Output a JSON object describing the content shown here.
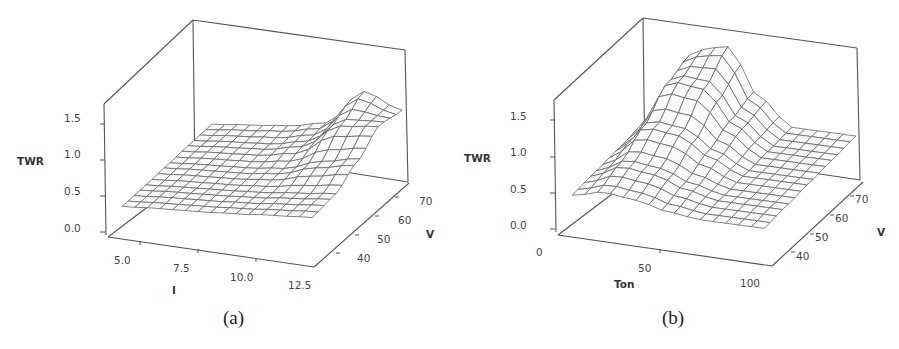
{
  "figure": {
    "panels": [
      {
        "id": "a",
        "caption": "(a)"
      },
      {
        "id": "b",
        "caption": "(b)"
      }
    ]
  },
  "chart_data": [
    {
      "type": "surface",
      "panel": "(a)",
      "title": "",
      "xlabel": "I",
      "ylabel": "V",
      "zlabel": "TWR",
      "x_ticks": [
        "5.0",
        "7.5",
        "10.0",
        "12.5"
      ],
      "y_ticks": [
        "40",
        "50",
        "60",
        "70"
      ],
      "z_ticks": [
        "0.0",
        "0.5",
        "1.0",
        "1.5"
      ],
      "xlim": [
        4,
        13
      ],
      "ylim": [
        35,
        75
      ],
      "zlim": [
        0,
        1.8
      ],
      "grid": "wireframe 15x15",
      "description": "Mostly flat surface around TWR ~0.3-0.5, with a ridge/peak rising to ~1.1 at high I (~11-12) and high V (~65-70); slight dip near I~9-10, V~50.",
      "x": [
        4.5,
        6.0,
        7.5,
        9.0,
        10.5,
        12.0
      ],
      "y": [
        38,
        46,
        54,
        62,
        70
      ],
      "z": [
        [
          0.3,
          0.33,
          0.35,
          0.38,
          0.42,
          0.45
        ],
        [
          0.32,
          0.35,
          0.37,
          0.4,
          0.45,
          0.5
        ],
        [
          0.35,
          0.38,
          0.4,
          0.45,
          0.6,
          0.7
        ],
        [
          0.38,
          0.42,
          0.45,
          0.55,
          0.9,
          0.95
        ],
        [
          0.4,
          0.45,
          0.5,
          0.6,
          1.1,
          0.9
        ]
      ]
    },
    {
      "type": "surface",
      "panel": "(b)",
      "title": "",
      "xlabel": "Ton",
      "ylabel": "V",
      "zlabel": "TWR",
      "x_ticks": [
        "0",
        "50",
        "100"
      ],
      "y_ticks": [
        "40",
        "50",
        "60",
        "70"
      ],
      "z_ticks": [
        "0.0",
        "0.5",
        "1.0",
        "1.5"
      ],
      "xlim": [
        0,
        105
      ],
      "ylim": [
        35,
        75
      ],
      "zlim": [
        0,
        1.8
      ],
      "grid": "wireframe 15x15",
      "description": "Pronounced peak of TWR ~1.5 at Ton ~20-30 and high V (~65-70); surface falls off to ~0.3-0.5 for Ton > 60 and at low V.",
      "x": [
        5,
        20,
        35,
        50,
        65,
        80,
        95
      ],
      "y": [
        38,
        46,
        54,
        62,
        70
      ],
      "z": [
        [
          0.4,
          0.5,
          0.45,
          0.35,
          0.3,
          0.3,
          0.3
        ],
        [
          0.45,
          0.65,
          0.6,
          0.45,
          0.35,
          0.35,
          0.35
        ],
        [
          0.5,
          0.9,
          0.85,
          0.6,
          0.4,
          0.4,
          0.4
        ],
        [
          0.55,
          1.25,
          1.2,
          0.75,
          0.45,
          0.45,
          0.45
        ],
        [
          0.55,
          1.4,
          1.5,
          0.85,
          0.5,
          0.5,
          0.5
        ]
      ]
    }
  ]
}
